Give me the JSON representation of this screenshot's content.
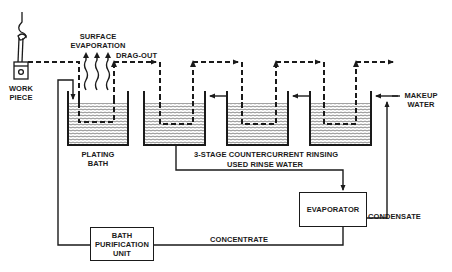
{
  "diagram": {
    "labels": {
      "work_piece": "WORK\nPIECE",
      "work_piece_line1": "WORK",
      "work_piece_line2": "PIECE",
      "surface_evaporation_line1": "SURFACE",
      "surface_evaporation_line2": "EVAPORATION",
      "drag_out": "DRAG-OUT",
      "plating_bath_line1": "PLATING",
      "plating_bath_line2": "BATH",
      "rinsing": "3-STAGE COUNTERCURRENT RINSING",
      "used_rinse_water": "USED RINSE WATER",
      "makeup_water_line1": "MAKEUP",
      "makeup_water_line2": "WATER",
      "condensate": "CONDENSATE",
      "concentrate": "CONCENTRATE"
    },
    "boxes": {
      "evaporator": "EVAPORATOR",
      "bath_purification_line1": "BATH",
      "bath_purification_line2": "PURIFICATION",
      "bath_purification_line3": "UNIT"
    },
    "tanks": [
      {
        "name": "plating-bath",
        "x": 67,
        "w": 61
      },
      {
        "name": "rinse-tank-1",
        "x": 143,
        "w": 62
      },
      {
        "name": "rinse-tank-2",
        "x": 226,
        "w": 62
      },
      {
        "name": "rinse-tank-3",
        "x": 309,
        "w": 62
      }
    ],
    "colors": {
      "ink": "#1a1a1a",
      "background": "#ffffff"
    }
  }
}
